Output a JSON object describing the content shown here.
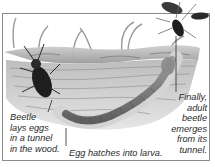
{
  "diagram": {
    "captions": {
      "lay_eggs": [
        "Beetle",
        "lays eggs",
        "in a tunnel",
        "in the wood."
      ],
      "hatch": "Egg hatches into larva.",
      "emerge": [
        "Finally,",
        "adult",
        "beetle",
        "emerges",
        "from its",
        "tunnel."
      ]
    },
    "elements": [
      "wood-log-cross-section",
      "adult-beetle-on-wood",
      "tunnel-with-larva",
      "flying-adult-beetle",
      "grass-blades"
    ],
    "colors": {
      "border": "#8a8a8a",
      "text": "#2a2a2a",
      "wood_light": "#d8d8d8",
      "wood_dark": "#6e6e6e",
      "beetle": "#1e1e1e"
    }
  }
}
